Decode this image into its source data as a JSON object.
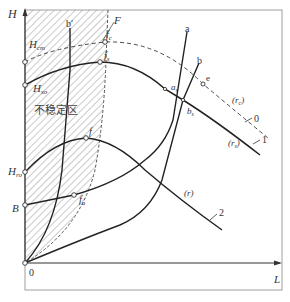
{
  "figure": {
    "axes": {
      "y_label": "H",
      "x_label": "L",
      "origin_label": "0"
    },
    "region_label": "不稳定区",
    "colors": {
      "line": "#2a2a2a",
      "frame": "#9a9a9a",
      "hatch": "#9a9a9a"
    },
    "axis_points": {
      "H_cm": {
        "main": "H",
        "sub": "cm"
      },
      "H_so": {
        "main": "H",
        "sub": "so"
      },
      "H_ro": {
        "main": "H",
        "sub": "ro"
      },
      "B": "B"
    },
    "curve_points": {
      "f_c": {
        "main": "f",
        "sub": "c"
      },
      "f_s": {
        "main": "f",
        "sub": "s"
      },
      "f": "f",
      "f_a": {
        "main": "f",
        "sub": "a"
      },
      "a_s": {
        "main": "a",
        "sub": "s"
      },
      "b_s": {
        "main": "b",
        "sub": "s"
      },
      "e": "e"
    },
    "line_labels": {
      "F": "F",
      "a": "a",
      "b": "b",
      "b_prime": "b′"
    },
    "curve_labels": {
      "r_c": {
        "open": "(",
        "main": "r",
        "sub": "c",
        "close": ")"
      },
      "r_s": {
        "open": "(",
        "main": "r",
        "sub": "s",
        "close": ")"
      },
      "r": "(r)"
    },
    "curve_numbers": {
      "c0": "0",
      "c1": "1",
      "c2": "2"
    }
  }
}
